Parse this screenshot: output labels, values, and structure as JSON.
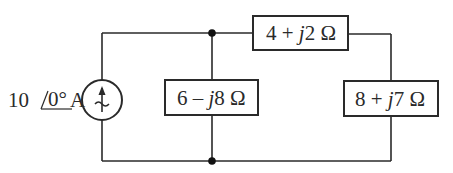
{
  "diagram": {
    "type": "ac-circuit",
    "source": {
      "kind": "current-source",
      "magnitude": "10",
      "angle": "0°",
      "unit": "A",
      "label_magnitude": "10",
      "label_angle": "0°",
      "label_unit": "A"
    },
    "impedances": [
      {
        "id": "Z1",
        "position": "top",
        "real": "4",
        "sign": "+",
        "imag_prefix": "j",
        "imag": "2",
        "unit": "Ω"
      },
      {
        "id": "Z2",
        "position": "middle",
        "real": "6",
        "sign": "–",
        "imag_prefix": "j",
        "imag": "8",
        "unit": "Ω"
      },
      {
        "id": "Z3",
        "position": "right",
        "real": "8",
        "sign": "+",
        "imag_prefix": "j",
        "imag": "7",
        "unit": "Ω"
      }
    ],
    "nodes": [
      "top",
      "bottom"
    ],
    "colors": {
      "line": "#2a2a2a",
      "node": "#111111",
      "background": "#ffffff"
    }
  }
}
